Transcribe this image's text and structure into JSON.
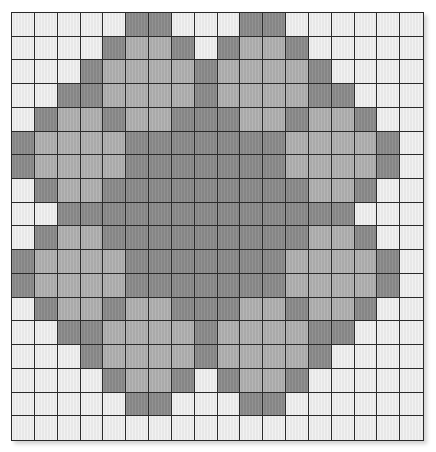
{
  "diagram": {
    "type": "pixel-grid-pattern",
    "rows": 18,
    "cols": 18,
    "palette": {
      "W": "#f1f1f1",
      "L": "#b1b1b1",
      "D": "#8b8b8b",
      "grid_line": "#2a2a2a"
    },
    "pattern": [
      "WWWWWDDWWWDDWWWWWW",
      "WWWWDLLDWDLLDWWWWW",
      "WWWDLLLLDLLLLDWWWW",
      "WWDDLLLLDLLLLDDWWW",
      "WDLLDLLDDDLLDLLDWW",
      "DLLLLDDDDDDDLLLLDW",
      "DLLLLDDDDDDDLLLLDW",
      "WDLLDDDDDDDDDLLDWW",
      "WWDDDDDDDDDDDDDWWW",
      "WDLLDDDDDDDDDLLDWW",
      "DLLLLDDDDDDDLLLLDW",
      "DLLLLDDDDDDDLLLLDW",
      "WDLLDLLDDDLLDLLDWW",
      "WWDDLLLLDLLLLDDWWW",
      "WWWDLLLLDLLLLDWWWW",
      "WWWWDLLDWDLLDWWWWW",
      "WWWWWDDWWWDDWWWWWW",
      "WWWWWWWWWWWWWWWWWW"
    ]
  }
}
